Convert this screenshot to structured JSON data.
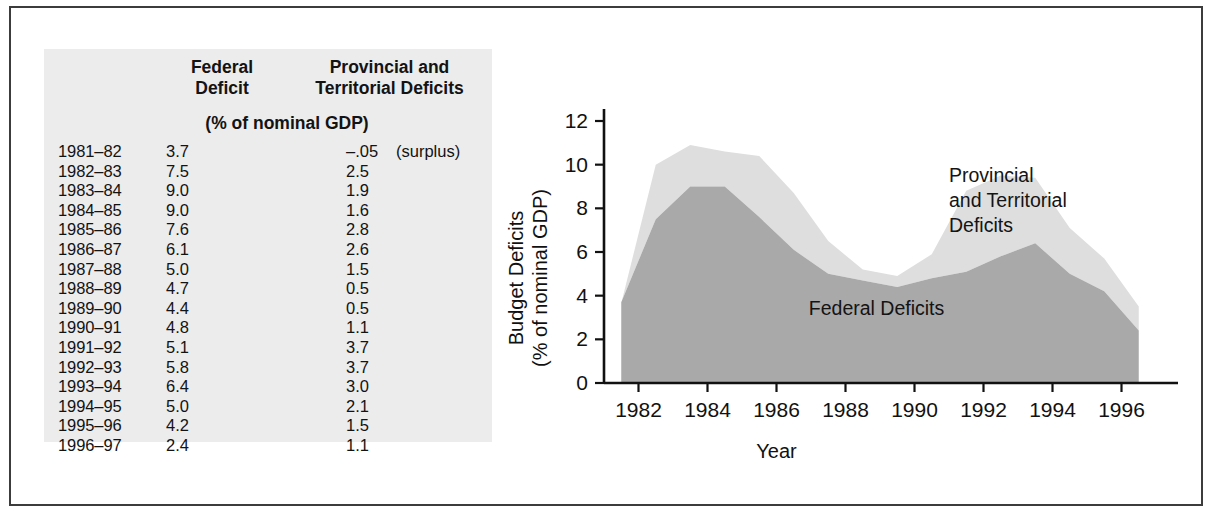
{
  "figure": {
    "border_color": "#3c3c3c",
    "panel_bg": "#ececed"
  },
  "table": {
    "headers": {
      "year": "",
      "federal": "Federal\nDeficit",
      "federal_line1": "Federal",
      "federal_line2": "Deficit",
      "provincial_line1": "Provincial and",
      "provincial_line2": "Territorial Deficits",
      "units": "(% of nominal GDP)"
    },
    "rows": [
      {
        "year": "1981–82",
        "federal": "3.7",
        "provincial": "–.05",
        "note": "(surplus)"
      },
      {
        "year": "1982–83",
        "federal": "7.5",
        "provincial": "2.5",
        "note": ""
      },
      {
        "year": "1983–84",
        "federal": "9.0",
        "provincial": "1.9",
        "note": ""
      },
      {
        "year": "1984–85",
        "federal": "9.0",
        "provincial": "1.6",
        "note": ""
      },
      {
        "year": "1985–86",
        "federal": "7.6",
        "provincial": "2.8",
        "note": ""
      },
      {
        "year": "1986–87",
        "federal": "6.1",
        "provincial": "2.6",
        "note": ""
      },
      {
        "year": "1987–88",
        "federal": "5.0",
        "provincial": "1.5",
        "note": ""
      },
      {
        "year": "1988–89",
        "federal": "4.7",
        "provincial": "0.5",
        "note": ""
      },
      {
        "year": "1989–90",
        "federal": "4.4",
        "provincial": "0.5",
        "note": ""
      },
      {
        "year": "1990–91",
        "federal": "4.8",
        "provincial": "1.1",
        "note": ""
      },
      {
        "year": "1991–92",
        "federal": "5.1",
        "provincial": "3.7",
        "note": ""
      },
      {
        "year": "1992–93",
        "federal": "5.8",
        "provincial": "3.7",
        "note": ""
      },
      {
        "year": "1993–94",
        "federal": "6.4",
        "provincial": "3.0",
        "note": ""
      },
      {
        "year": "1994–95",
        "federal": "5.0",
        "provincial": "2.1",
        "note": ""
      },
      {
        "year": "1995–96",
        "federal": "4.2",
        "provincial": "1.5",
        "note": ""
      },
      {
        "year": "1996–97",
        "federal": "2.4",
        "provincial": "1.1",
        "note": ""
      }
    ]
  },
  "chart_data": {
    "type": "area",
    "title": "",
    "xlabel": "Year",
    "ylabel": "Budget Deficits\n(% of nominal GDP)",
    "ylabel_line1": "Budget Deficits",
    "ylabel_line2": "(% of nominal GDP)",
    "xlim": [
      1981,
      1997
    ],
    "ylim": [
      0,
      12
    ],
    "yticks": [
      0,
      2,
      4,
      6,
      8,
      10,
      12
    ],
    "ytick_labels": [
      "0",
      "2",
      "4",
      "6",
      "8",
      "10",
      "12"
    ],
    "xticks": [
      1982,
      1984,
      1986,
      1988,
      1990,
      1992,
      1994,
      1996
    ],
    "xtick_labels": [
      "1982",
      "1984",
      "1986",
      "1988",
      "1990",
      "1992",
      "1994",
      "1996"
    ],
    "grid": false,
    "stacked": true,
    "x": [
      1981.5,
      1982.5,
      1983.5,
      1984.5,
      1985.5,
      1986.5,
      1987.5,
      1988.5,
      1989.5,
      1990.5,
      1991.5,
      1992.5,
      1993.5,
      1994.5,
      1995.5,
      1996.5
    ],
    "series": [
      {
        "name": "Federal Deficits",
        "color": "#a9a9a9",
        "values": [
          3.7,
          7.5,
          9.0,
          9.0,
          7.6,
          6.1,
          5.0,
          4.7,
          4.4,
          4.8,
          5.1,
          5.8,
          6.4,
          5.0,
          4.2,
          2.4
        ]
      },
      {
        "name": "Provincial and Territorial Deficits",
        "color": "#dedede",
        "values": [
          -0.05,
          2.5,
          1.9,
          1.6,
          2.8,
          2.6,
          1.5,
          0.5,
          0.5,
          1.1,
          3.7,
          3.7,
          3.0,
          2.1,
          1.5,
          1.1
        ]
      }
    ],
    "annotations": [
      {
        "text": "Provincial\nand Territorial\nDeficits",
        "line1": "Provincial",
        "line2": "and Territorial",
        "line3": "Deficits",
        "x": 1991.0,
        "y": 9.2
      },
      {
        "text": "Federal Deficits",
        "line1": "Federal Deficits",
        "x": 1988.9,
        "y": 3.1
      }
    ]
  }
}
